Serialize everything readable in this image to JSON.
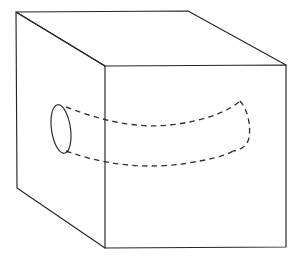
{
  "figure": {
    "canvas": {
      "width": 303,
      "height": 262,
      "background": "#ffffff"
    },
    "styles": {
      "solid_edge_color": "#262626",
      "solid_edge_width": 1.15,
      "hidden_edge_color": "#333333",
      "hidden_edge_width": 1.35,
      "hidden_dash_pattern": "5.5 4.2",
      "face_fill_color": "#ffffff"
    },
    "shapes": {
      "cube": {
        "name": "cube",
        "projection": "oblique-cabinet",
        "vertices": {
          "front_top_left": [
            105,
            66
          ],
          "front_top_right": [
            286,
            65
          ],
          "front_bottom_right": [
            286,
            247
          ],
          "front_bottom_left": [
            105,
            248
          ],
          "back_top_left": [
            16,
            12
          ],
          "back_top_right": [
            188,
            11
          ],
          "back_bottom_left": [
            17,
            188
          ]
        },
        "front_face_path": "M105,66 L286,65 L286,247 L105,248 Z",
        "top_face_path": "M105,66 L16,12 L188,11 L286,65",
        "left_face_path": "M105,66 L16,12 L17,188 L105,248",
        "visible_edges": [
          "back_top_left->back_top_right",
          "back_top_right->front_top_right",
          "back_top_left->front_top_left",
          "back_top_left->back_bottom_left",
          "back_bottom_left->front_bottom_left",
          "front_top_left->front_top_right",
          "front_top_right->front_bottom_right",
          "front_bottom_right->front_bottom_left",
          "front_bottom_left->front_top_left"
        ]
      },
      "tube_mouth_ellipse": {
        "name": "tube-mouth-ellipse",
        "center": [
          61,
          129
        ],
        "radius_x": 9.5,
        "radius_y": 24.5,
        "rotation_deg": -8,
        "style": "solid"
      },
      "tube_upper_edge": {
        "name": "tube-upper-hidden-edge",
        "style": "dashed",
        "path": "M66,107 C110,124 145,129 178,124 C205,120 228,112 240,101"
      },
      "tube_lower_edge": {
        "name": "tube-lower-hidden-edge",
        "style": "dashed",
        "path": "M66,151 C110,167 150,168 182,164 C208,160 226,156 233,151"
      },
      "tube_far_cap": {
        "name": "tube-far-end-hidden-cap",
        "style": "dashed",
        "path": "M240,101 C248,110 251,126 249,138 C247,146 241,150 233,151"
      }
    }
  }
}
